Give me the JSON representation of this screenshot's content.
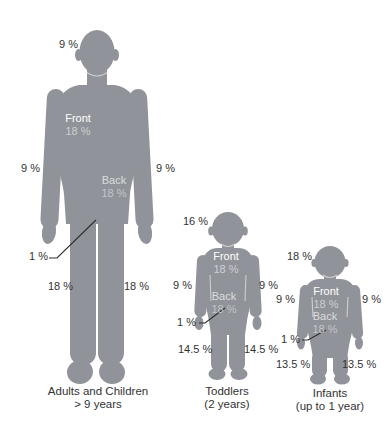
{
  "diagram": {
    "name": "Rule of Nines — body surface area percentages",
    "colors": {
      "background": "#FFFFFF",
      "body": "#909399",
      "label_text": "#333333",
      "caption_text": "#333333",
      "front_title": "#FFFFFF",
      "front_value": "#CDD0D3",
      "back_title": "#DBDDDF",
      "back_value": "#C3C6C9",
      "leader": "#2E2E2E"
    },
    "figures": [
      {
        "id": "adults",
        "caption_line1": "Adults and Children",
        "caption_line2": "> 9 years",
        "head": "9 %",
        "front_title": "Front",
        "front_value": "18 %",
        "back_title": "Back",
        "back_value": "18 %",
        "arm_left": "9 %",
        "arm_right": "9 %",
        "genitals": "1 %",
        "leg_left": "18 %",
        "leg_right": "18 %"
      },
      {
        "id": "toddlers",
        "caption_line1": "Toddlers",
        "caption_line2": "(2 years)",
        "head": "16 %",
        "front_title": "Front",
        "front_value": "18 %",
        "back_title": "Back",
        "back_value": "18 %",
        "arm_left": "9 %",
        "arm_right": "9 %",
        "genitals": "1 %",
        "leg_left": "14.5 %",
        "leg_right": "14.5 %"
      },
      {
        "id": "infants",
        "caption_line1": "Infants",
        "caption_line2": "(up to 1 year)",
        "head": "18 %",
        "front_title": "Front",
        "front_value": "18 %",
        "back_title": "Back",
        "back_value": "18 %",
        "arm_left": "9 %",
        "arm_right": "9 %",
        "genitals": "1 %",
        "leg_left": "13.5 %",
        "leg_right": "13.5 %"
      }
    ]
  }
}
